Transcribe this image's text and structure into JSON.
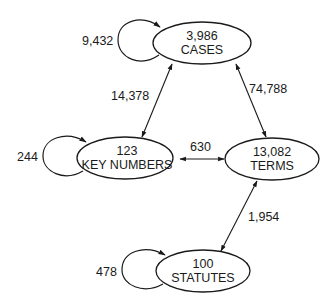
{
  "diagram": {
    "type": "directed-graph",
    "nodes": {
      "cases": {
        "count": "3,986",
        "label": "CASES"
      },
      "key_numbers": {
        "count": "123",
        "label": "KEY NUMBERS"
      },
      "terms": {
        "count": "13,082",
        "label": "TERMS"
      },
      "statutes": {
        "count": "100",
        "label": "STATUTES"
      }
    },
    "self_loops": {
      "cases": "9,432",
      "key_numbers": "244",
      "statutes": "478"
    },
    "edges": {
      "cases_key_numbers": {
        "from": "CASES",
        "to": "KEY NUMBERS",
        "label": "14,378",
        "direction": "bidirectional"
      },
      "cases_terms": {
        "from": "CASES",
        "to": "TERMS",
        "label": "74,788",
        "direction": "bidirectional"
      },
      "key_numbers_terms": {
        "from": "KEY NUMBERS",
        "to": "TERMS",
        "label": "630",
        "direction": "bidirectional"
      },
      "terms_statutes": {
        "from": "TERMS",
        "to": "STATUTES",
        "label": "1,954",
        "direction": "bidirectional"
      }
    },
    "colors": {
      "stroke": "#1a1a1a",
      "background": "#ffffff"
    }
  }
}
